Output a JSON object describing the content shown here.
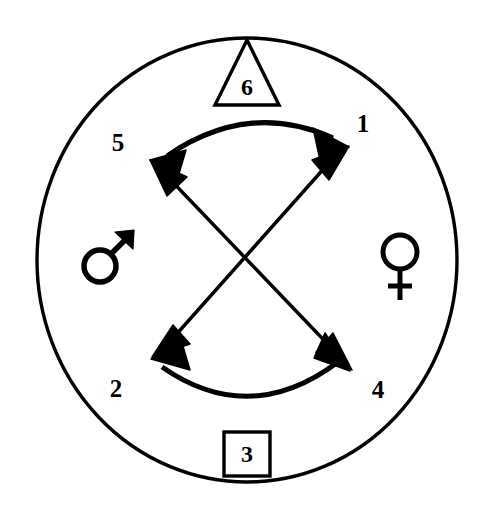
{
  "diagram": {
    "background_color": "#ffffff",
    "stroke_color": "#000000",
    "outer_circle": {
      "name": "outer-boundary-circle",
      "center_x": 247,
      "center_y": 260,
      "radius_x": 210,
      "radius_y": 222,
      "stroke_width": 3.2
    },
    "symbols": {
      "mars": {
        "glyph": "♂",
        "name": "mars-male-symbol",
        "x": 105,
        "y": 261
      },
      "venus": {
        "glyph": "♀",
        "name": "venus-female-symbol",
        "x": 400,
        "y": 262
      }
    },
    "markers": {
      "triangle": {
        "label": "6",
        "shape": "triangle",
        "apex_x": 247,
        "apex_y": 40,
        "base_left_x": 216,
        "base_left_y": 104,
        "base_right_x": 278,
        "base_right_y": 104,
        "label_x": 247,
        "label_y": 87
      },
      "square": {
        "label": "3",
        "shape": "square",
        "x": 224,
        "y": 432,
        "width": 46,
        "height": 44,
        "label_x": 247,
        "label_y": 455
      }
    },
    "nodes": [
      {
        "label": "1",
        "position": "upper-right",
        "label_x": 363,
        "label_y": 126,
        "tip_x": 345,
        "tip_y": 144
      },
      {
        "label": "2",
        "position": "lower-left",
        "label_x": 116,
        "label_y": 391,
        "tip_x": 155,
        "tip_y": 355
      },
      {
        "label": "4",
        "position": "lower-right",
        "label_x": 378,
        "label_y": 392,
        "tip_x": 348,
        "tip_y": 368
      },
      {
        "label": "5",
        "position": "upper-left",
        "label_x": 118,
        "label_y": 145,
        "tip_x": 152,
        "tip_y": 161
      }
    ],
    "connections": [
      {
        "name": "upper-curved-arrow",
        "from": "5",
        "to": "1",
        "style": "curved-double-headed",
        "bulge": "upward"
      },
      {
        "name": "lower-curved-arrow",
        "from": "2",
        "to": "4",
        "style": "curved-double-headed",
        "bulge": "downward"
      },
      {
        "name": "diagonal-arrow-5-4",
        "from": "5",
        "to": "4",
        "style": "straight-double-headed"
      },
      {
        "name": "diagonal-arrow-1-2",
        "from": "1",
        "to": "2",
        "style": "straight-double-headed"
      }
    ],
    "crossing_point": {
      "x": 247,
      "y": 265
    }
  }
}
